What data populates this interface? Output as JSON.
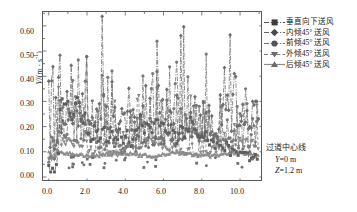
{
  "chart_data": {
    "type": "line",
    "title": "",
    "xlabel": "X/m",
    "ylabel": "V/(m · s⁻¹)",
    "xlim": [
      -0.3,
      11.2
    ],
    "ylim": [
      -0.02,
      0.655
    ],
    "xticks": [
      "0.0",
      "2.0",
      "4.0",
      "6.0",
      "8.0",
      "10.0"
    ],
    "xtick_values": [
      0.0,
      2.0,
      4.0,
      6.0,
      8.0,
      10.0
    ],
    "yticks": [
      "0.00",
      "0.10",
      "0.20",
      "0.30",
      "0.40",
      "0.50",
      "0.60"
    ],
    "ytick_values": [
      0.0,
      0.1,
      0.2,
      0.3,
      0.4,
      0.5,
      0.6
    ],
    "grid": false,
    "legend_position": "outside-right-top",
    "series": [
      {
        "name": "垂直向下送风",
        "marker": "square",
        "linestyle": "dash-dot",
        "color": "#555555",
        "mean_level": 0.17,
        "x": [
          0.0,
          0.1,
          0.2,
          0.3,
          0.4,
          0.5,
          0.6,
          0.7,
          0.8,
          0.9,
          1.0,
          1.1,
          1.2,
          1.3,
          1.4,
          1.5,
          1.6,
          1.7,
          1.8,
          1.9,
          2.0,
          2.1,
          2.2,
          2.3,
          2.4,
          2.5,
          2.6,
          2.7,
          2.8,
          2.9,
          3.0,
          3.1,
          3.2,
          3.3,
          3.4,
          3.5,
          3.6,
          3.7,
          3.8,
          3.9,
          4.0,
          4.1,
          4.2,
          4.3,
          4.4,
          4.5,
          4.6,
          4.7,
          4.8,
          4.9,
          5.0,
          5.1,
          5.2,
          5.3,
          5.4,
          5.5,
          5.6,
          5.7,
          5.8,
          5.9,
          6.0,
          6.1,
          6.2,
          6.3,
          6.4,
          6.5,
          6.6,
          6.7,
          6.8,
          6.9,
          7.0,
          7.1,
          7.2,
          7.3,
          7.4,
          7.5,
          7.6,
          7.7,
          7.8,
          7.9,
          8.0,
          8.1,
          8.2,
          8.3,
          8.4,
          8.5,
          8.6,
          8.7,
          8.8,
          8.9,
          9.0,
          9.1,
          9.2,
          9.3,
          9.4,
          9.5,
          9.6,
          9.7,
          9.8,
          9.9,
          10.0,
          10.1,
          10.2,
          10.3,
          10.4,
          10.5,
          10.6,
          10.7,
          10.8,
          10.9
        ],
        "values": [
          0.04,
          0.03,
          0.05,
          0.02,
          0.04,
          0.08,
          0.26,
          0.31,
          0.3,
          0.28,
          0.3,
          0.26,
          0.21,
          0.24,
          0.31,
          0.33,
          0.29,
          0.22,
          0.2,
          0.24,
          0.19,
          0.17,
          0.14,
          0.16,
          0.2,
          0.17,
          0.13,
          0.15,
          0.19,
          0.18,
          0.15,
          0.13,
          0.16,
          0.19,
          0.16,
          0.14,
          0.16,
          0.18,
          0.15,
          0.13,
          0.15,
          0.17,
          0.14,
          0.13,
          0.15,
          0.17,
          0.18,
          0.21,
          0.23,
          0.21,
          0.19,
          0.2,
          0.22,
          0.21,
          0.19,
          0.22,
          0.23,
          0.21,
          0.19,
          0.21,
          0.22,
          0.2,
          0.18,
          0.17,
          0.19,
          0.18,
          0.16,
          0.15,
          0.17,
          0.19,
          0.18,
          0.16,
          0.18,
          0.2,
          0.22,
          0.21,
          0.19,
          0.17,
          0.18,
          0.17,
          0.16,
          0.15,
          0.17,
          0.16,
          0.14,
          0.15,
          0.13,
          0.12,
          0.14,
          0.13,
          0.12,
          0.11,
          0.12,
          0.13,
          0.11,
          0.1,
          0.12,
          0.11,
          0.1,
          0.09,
          0.11,
          0.1,
          0.09,
          0.1,
          0.09,
          0.08,
          0.09,
          0.08,
          0.09,
          0.08
        ]
      },
      {
        "name": "内倾45° 送风",
        "marker": "diamond",
        "linestyle": "dash-dot",
        "color": "#666666",
        "mean_level": 0.28,
        "peak_max": 0.63
      },
      {
        "name": "前倾45° 送风",
        "marker": "circle",
        "linestyle": "dash-dot",
        "color": "#777777",
        "mean_level": 0.2
      },
      {
        "name": "外倾45° 送风",
        "marker": "triangle-down",
        "linestyle": "dashed",
        "color": "#808080",
        "mean_level": 0.15
      },
      {
        "name": "后倾45° 送风",
        "marker": "triangle-up",
        "linestyle": "solid",
        "color": "#8a8a8a",
        "mean_level": 0.095
      }
    ],
    "annotations": [
      "过道中心线",
      "Y=0 m",
      "Z=1.2 m"
    ]
  },
  "axes": {
    "y_title": "V/(m · s⁻¹)",
    "y_title_symbol": "V",
    "y_title_rest": "/(m · s",
    "y_title_sup": "-1",
    "y_title_tail": ")",
    "x_title_symbol": "X",
    "x_title_rest": "/m",
    "yticks": [
      "0.60",
      "0.50",
      "0.40",
      "0.30",
      "0.20",
      "0.10",
      "0.00"
    ],
    "xticks": [
      "0.0",
      "2.0",
      "4.0",
      "6.0",
      "8.0",
      "10.0"
    ]
  },
  "legend": {
    "items": [
      {
        "label": "垂直向下送风"
      },
      {
        "label": "内倾45°  送风"
      },
      {
        "label": "前倾45°  送风"
      },
      {
        "label": "外倾45°  送风"
      },
      {
        "label": "后倾45°  送风"
      }
    ]
  },
  "annotation": {
    "line1": "过道中心线",
    "line2": "Y=0 m",
    "line3": "Z=1.2 m",
    "line2_symbol": "Y",
    "line2_rest": "=0 m",
    "line3_symbol": "Z",
    "line3_rest": "=1.2 m"
  },
  "colors": {
    "frame": "#5a5a5a",
    "s1": "#555555",
    "s2": "#6b6b6b",
    "s3": "#767676",
    "s4": "#828282",
    "s5": "#909090"
  }
}
